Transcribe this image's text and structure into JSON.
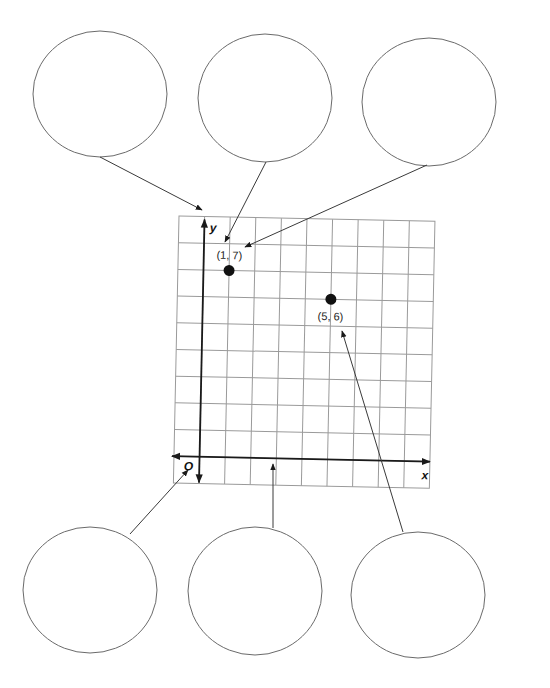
{
  "diagram": {
    "type": "coordinate-plane-labeling-worksheet",
    "plane": {
      "columns": 10,
      "rows": 10,
      "origin_col": 1,
      "origin_row_from_top": 9,
      "x_axis_label": "x",
      "y_axis_label": "y",
      "origin_label": "O"
    },
    "points": [
      {
        "label": "(1, 7)",
        "x": 1,
        "y": 7
      },
      {
        "label": "(5, 6)",
        "x": 5,
        "y": 6
      }
    ],
    "callout_ovals": [
      {
        "id": "top-left",
        "text": "",
        "points_to": "y-axis"
      },
      {
        "id": "top-middle",
        "text": "",
        "points_to": "x-coordinate of (1, 7)"
      },
      {
        "id": "top-right",
        "text": "",
        "points_to": "y-coordinate of (1, 7)"
      },
      {
        "id": "bottom-left",
        "text": "",
        "points_to": "origin"
      },
      {
        "id": "bottom-middle",
        "text": "",
        "points_to": "x-axis"
      },
      {
        "id": "bottom-right",
        "text": "",
        "points_to": "ordered pair (5, 6)"
      }
    ],
    "colors": {
      "ink": "#1a1a1a",
      "grid": "#9a9a9a",
      "oval": "#6a6a6a"
    }
  }
}
